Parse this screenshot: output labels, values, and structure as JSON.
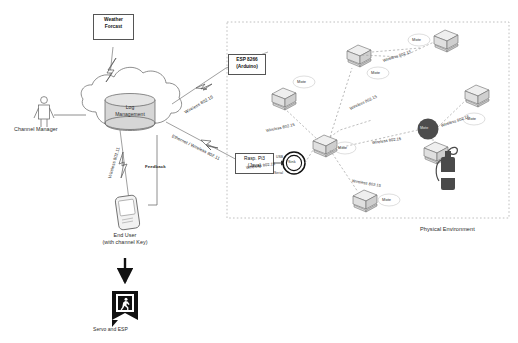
{
  "diagram": {
    "colors": {
      "line": "#555555",
      "dashed": "#9a9a9a",
      "cloud_fill": "#ffffff",
      "cylinder_fill": "#d9d9d9",
      "mote_fill": "#e8e8e8",
      "dark_node": "#4a4a4a",
      "exit_sign": "#111111",
      "extinguisher": "#3f3f3f",
      "boundary": "#b5b5b5"
    },
    "nodes": {
      "weather_forecast": "Weather\nForcast",
      "weather_forecast_line1": "Weather",
      "weather_forecast_line2": "Forcast",
      "log_management_line1": "Log",
      "log_management_line2": "Management",
      "channel_manager": "Channel Manager",
      "end_user_line1": "End User",
      "end_user_line2": "(with channel Key)",
      "servo_esp": "Servo and ESP",
      "esp8266_line1": "ESP 8266",
      "esp8266_line2": "(Arduino)",
      "rasppi_line1": "Rasp. Pi3",
      "rasppi_line2": "(Java)",
      "sink": "Sink",
      "dark_node": "Sensor",
      "physical_environment": "Physical Environment"
    },
    "link_labels": {
      "wireless_80215_cloud": "Wireless 802.15",
      "ethernet_wireless_80211": "Ethernet / Wireless 802.11",
      "wireless_80211_user": "Wireless 802.11",
      "feedback": "Feedback",
      "usb": "USB",
      "serial": "Serial"
    },
    "motes": [
      {
        "id": "mote-1",
        "label": "Mote"
      },
      {
        "id": "mote-2",
        "label": "Mote"
      },
      {
        "id": "mote-3",
        "label": "Mote"
      },
      {
        "id": "mote-4",
        "label": "Mote"
      },
      {
        "id": "mote-5",
        "label": "Mote"
      },
      {
        "id": "mote-6",
        "label": "Mote"
      },
      {
        "id": "mote-7",
        "label": "Mote"
      }
    ],
    "wireless_links": [
      {
        "id": "link-1",
        "label": "Wireless 802.15"
      },
      {
        "id": "link-2",
        "label": "Wireless 802.15"
      },
      {
        "id": "link-3",
        "label": "Wireless 802.15"
      },
      {
        "id": "link-4",
        "label": "Wireless 802.15"
      },
      {
        "id": "link-5",
        "label": "Wireless 802.15"
      },
      {
        "id": "link-6",
        "label": "Wireless 802.15"
      },
      {
        "id": "link-7",
        "label": "Wireless 802.15"
      }
    ]
  }
}
